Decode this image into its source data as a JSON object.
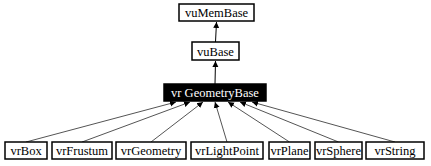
{
  "diagram": {
    "type": "class-inheritance-graph",
    "nodes": [
      {
        "id": "vuMemBase",
        "label": "vuMemBase",
        "highlighted": false
      },
      {
        "id": "vuBase",
        "label": "vuBase",
        "highlighted": false
      },
      {
        "id": "vrGeometryBase",
        "label": "vr GeometryBase",
        "highlighted": true
      },
      {
        "id": "vrBox",
        "label": "vrBox",
        "highlighted": false
      },
      {
        "id": "vrFrustum",
        "label": "vrFrustum",
        "highlighted": false
      },
      {
        "id": "vrGeometry",
        "label": "vrGeometry",
        "highlighted": false
      },
      {
        "id": "vrLightPoint",
        "label": "vrLightPoint",
        "highlighted": false
      },
      {
        "id": "vrPlane",
        "label": "vrPlane",
        "highlighted": false
      },
      {
        "id": "vrSphere",
        "label": "vrSphere",
        "highlighted": false
      },
      {
        "id": "vrString",
        "label": "vrString",
        "highlighted": false
      }
    ],
    "edges": [
      {
        "from": "vuBase",
        "to": "vuMemBase"
      },
      {
        "from": "vrGeometryBase",
        "to": "vuBase"
      },
      {
        "from": "vrBox",
        "to": "vrGeometryBase"
      },
      {
        "from": "vrFrustum",
        "to": "vrGeometryBase"
      },
      {
        "from": "vrGeometry",
        "to": "vrGeometryBase"
      },
      {
        "from": "vrLightPoint",
        "to": "vrGeometryBase"
      },
      {
        "from": "vrPlane",
        "to": "vrGeometryBase"
      },
      {
        "from": "vrSphere",
        "to": "vrGeometryBase"
      },
      {
        "from": "vrString",
        "to": "vrGeometryBase"
      }
    ],
    "colors": {
      "highlight_fill": "#000000",
      "highlight_text": "#ffffff",
      "node_fill": "#ffffff",
      "edge": "#555555"
    }
  }
}
